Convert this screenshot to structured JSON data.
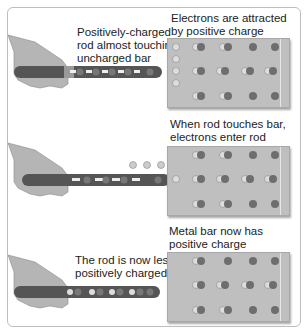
{
  "figure": {
    "panels": [
      {
        "id": "before-touch",
        "bar_caption": [
          "Electrons are attracted",
          "by positive charge"
        ],
        "rod_caption": [
          "Positively-charged",
          "rod almost touching",
          "uncharged bar"
        ]
      },
      {
        "id": "touching",
        "bar_caption": [
          "When rod touches bar,",
          "electrons enter rod"
        ],
        "rod_caption": []
      },
      {
        "id": "after-touch",
        "bar_caption": [
          "Metal bar now has",
          "positive charge"
        ],
        "rod_caption": [
          "The rod is now less",
          "positively charged"
        ]
      }
    ],
    "colors": {
      "bar": "#bfbfbf",
      "rod": "#555555",
      "proton": "#6e6e6e",
      "electron": "#d9d9d9",
      "hand": "#b5b5b5",
      "frame": "#bdbdbd"
    }
  }
}
